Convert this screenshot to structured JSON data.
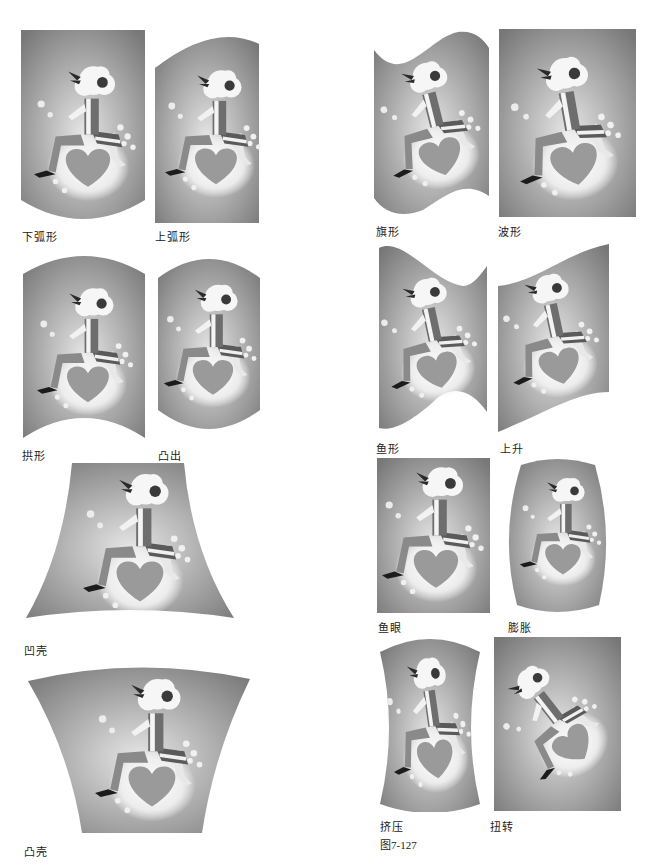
{
  "figure": {
    "caption": "图7-127",
    "colors": {
      "panel_dark": "#7a7a7a",
      "panel_light": "#d0d0d0",
      "glow": "#f4f4f4",
      "heart": "#9a9a9a",
      "text": "#222222"
    },
    "panels": [
      {
        "id": "arc-lower",
        "label": "下弧形"
      },
      {
        "id": "arc-upper",
        "label": "上弧形"
      },
      {
        "id": "flag",
        "label": "旗形"
      },
      {
        "id": "wave",
        "label": "波形"
      },
      {
        "id": "arch",
        "label": "拱形"
      },
      {
        "id": "bulge",
        "label": "凸出"
      },
      {
        "id": "fish",
        "label": "鱼形"
      },
      {
        "id": "rise",
        "label": "上升"
      },
      {
        "id": "shell-lower",
        "label": "凹壳"
      },
      {
        "id": "fisheye",
        "label": "鱼眼"
      },
      {
        "id": "inflate",
        "label": "膨胀"
      },
      {
        "id": "shell-upper",
        "label": "凸壳"
      },
      {
        "id": "squeeze",
        "label": "挤压"
      },
      {
        "id": "twist",
        "label": "扭转"
      }
    ]
  }
}
